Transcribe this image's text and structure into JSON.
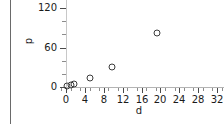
{
  "chart_data": {
    "type": "scatter",
    "title": "",
    "xlabel": "d",
    "ylabel": "p",
    "xlim": [
      -1.5,
      33.5
    ],
    "ylim": [
      -6,
      132
    ],
    "grid": false,
    "legend": null,
    "xticks": [
      0,
      4,
      8,
      12,
      16,
      20,
      24,
      28,
      32
    ],
    "xticklabels": [
      "0",
      "4",
      "8",
      "12",
      "16",
      "20",
      "24",
      "28",
      "32"
    ],
    "yticks": [
      0,
      60,
      120
    ],
    "yticklabels": [
      "0",
      "60",
      "120"
    ],
    "marker_style": "open-circle",
    "points": [
      {
        "d": 0.3,
        "p": 2
      },
      {
        "d": 1.0,
        "p": 3
      },
      {
        "d": 1.6,
        "p": 4
      },
      {
        "d": 5.0,
        "p": 13
      },
      {
        "d": 9.8,
        "p": 30
      },
      {
        "d": 19.2,
        "p": 82
      }
    ]
  },
  "axes": {
    "x_title": "d",
    "y_title": "p"
  },
  "colors": {
    "marker_stroke": "#3c3c3c",
    "axis": "#b4b4b4",
    "tick": "#4a4a4a",
    "text": "#1a1a1a",
    "panel_edge": "#6a6a6a",
    "background": "#ffffff"
  }
}
